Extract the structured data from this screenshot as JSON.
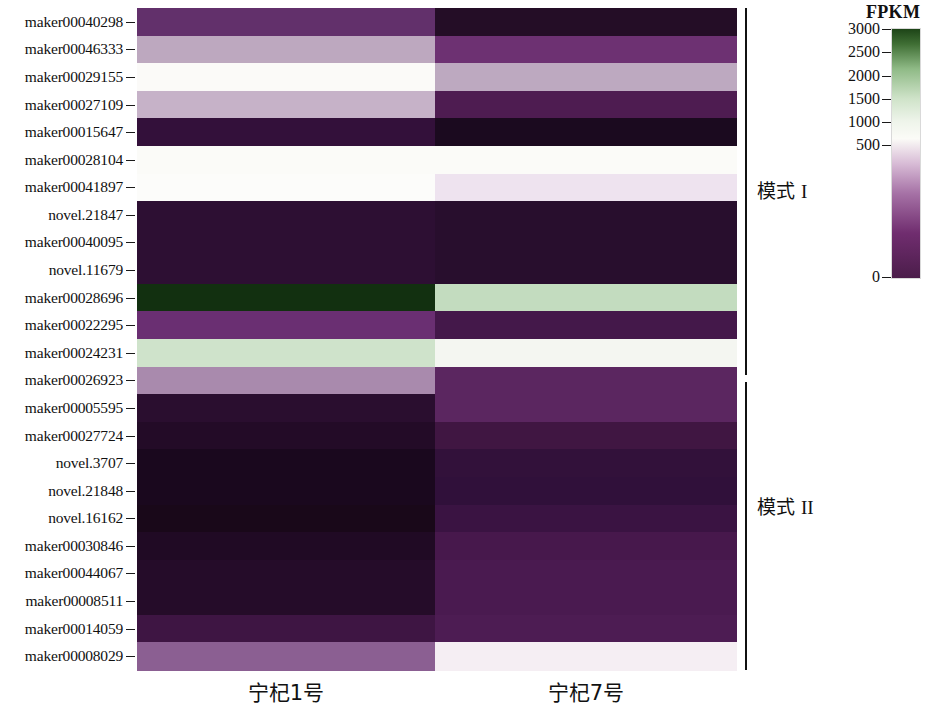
{
  "figure": {
    "type": "heatmap",
    "width": 935,
    "height": 702
  },
  "colorbar": {
    "title": "FPKM",
    "ticks": [
      {
        "label": "3000",
        "value": 3000
      },
      {
        "label": "2500",
        "value": 2500
      },
      {
        "label": "2000",
        "value": 2000
      },
      {
        "label": "1500",
        "value": 1500
      },
      {
        "label": "1000",
        "value": 1000
      },
      {
        "label": "500",
        "value": 500
      },
      {
        "label": "0",
        "value": 0
      }
    ],
    "low_color": "#4b1d4a",
    "mid_color": "#fbfbf7",
    "high_color": "#1d4417"
  },
  "columns": [
    {
      "label": "宁杞1号"
    },
    {
      "label": "宁杞7号"
    }
  ],
  "groups": [
    {
      "label": "模式",
      "roman": "I"
    },
    {
      "label": "模式",
      "roman": "II"
    }
  ],
  "chart_data": {
    "type": "heatmap",
    "title": "",
    "xlabel": "",
    "ylabel": "",
    "colorbar_label": "FPKM",
    "zlim": [
      0,
      3000
    ],
    "x": [
      "宁杞1号",
      "宁杞7号"
    ],
    "y": [
      "maker00040298",
      "maker00046333",
      "maker00029155",
      "maker00027109",
      "maker00015647",
      "maker00028104",
      "maker00041897",
      "novel.21847",
      "maker00040095",
      "novel.11679",
      "maker00028696",
      "maker00022295",
      "maker00024231",
      "maker00026923",
      "maker00005595",
      "maker00027724",
      "novel.3707",
      "novel.21848",
      "novel.16162",
      "maker00030846",
      "maker00044067",
      "maker00008511",
      "maker00014059",
      "maker00008029"
    ],
    "row_groups": [
      {
        "label": "模式 I",
        "rows": 14
      },
      {
        "label": "模式 II",
        "rows": 10
      }
    ],
    "cell_colors": [
      [
        "#62306b",
        "#240d26"
      ],
      [
        "#bda8bf",
        "#6d3172"
      ],
      [
        "#fbfaf8",
        "#bda9c0"
      ],
      [
        "#c6b2c8",
        "#4e1c51"
      ],
      [
        "#33103a",
        "#1b0a1f"
      ],
      [
        "#fbfbf8",
        "#fbfbf8"
      ],
      [
        "#fcfcfa",
        "#eee3ef"
      ],
      [
        "#2d0f33",
        "#280e2d"
      ],
      [
        "#2d0f33",
        "#280e2d"
      ],
      [
        "#2d0f33",
        "#280e2d"
      ],
      [
        "#123010",
        "#c3dcbf"
      ],
      [
        "#6a2f72",
        "#44184a"
      ],
      [
        "#cfe3cb",
        "#f4f6f1"
      ],
      [
        "#a98aad",
        "#5b2660"
      ],
      [
        "#2a0e2f",
        "#5b2660"
      ],
      [
        "#230b27",
        "#401642"
      ],
      [
        "#1a081e",
        "#32113a"
      ],
      [
        "#1a081e",
        "#30103a"
      ],
      [
        "#190819",
        "#3a1342"
      ],
      [
        "#200a24",
        "#47184c"
      ],
      [
        "#250c29",
        "#4a1a50"
      ],
      [
        "#250c29",
        "#4a1a50"
      ],
      [
        "#3e1543",
        "#4d1c53"
      ],
      [
        "#8b5f92",
        "#f5eef3"
      ]
    ],
    "estimated_values": [
      [
        380,
        110
      ],
      [
        900,
        430
      ],
      [
        1700,
        880
      ],
      [
        1050,
        280
      ],
      [
        150,
        80
      ],
      [
        1750,
        1750
      ],
      [
        1780,
        1400
      ],
      [
        130,
        115
      ],
      [
        130,
        115
      ],
      [
        130,
        115
      ],
      [
        2950,
        2100
      ],
      [
        420,
        215
      ],
      [
        2250,
        1800
      ],
      [
        750,
        330
      ],
      [
        120,
        330
      ],
      [
        100,
        195
      ],
      [
        70,
        145
      ],
      [
        70,
        140
      ],
      [
        68,
        165
      ],
      [
        90,
        235
      ],
      [
        105,
        250
      ],
      [
        105,
        250
      ],
      [
        185,
        260
      ],
      [
        600,
        1720
      ]
    ]
  },
  "rows": [
    {
      "label": "maker00040298"
    },
    {
      "label": "maker00046333"
    },
    {
      "label": "maker00029155"
    },
    {
      "label": "maker00027109"
    },
    {
      "label": "maker00015647"
    },
    {
      "label": "maker00028104"
    },
    {
      "label": "maker00041897"
    },
    {
      "label": "novel.21847"
    },
    {
      "label": "maker00040095"
    },
    {
      "label": "novel.11679"
    },
    {
      "label": "maker00028696"
    },
    {
      "label": "maker00022295"
    },
    {
      "label": "maker00024231"
    },
    {
      "label": "maker00026923"
    },
    {
      "label": "maker00005595"
    },
    {
      "label": "maker00027724"
    },
    {
      "label": "novel.3707"
    },
    {
      "label": "novel.21848"
    },
    {
      "label": "novel.16162"
    },
    {
      "label": "maker00030846"
    },
    {
      "label": "maker00044067"
    },
    {
      "label": "maker00008511"
    },
    {
      "label": "maker00014059"
    },
    {
      "label": "maker00008029"
    }
  ]
}
